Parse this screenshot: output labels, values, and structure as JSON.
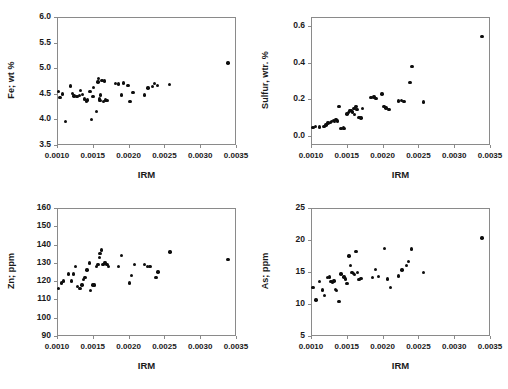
{
  "figure": {
    "panel_count": 4,
    "shared_xlabel": "IRM",
    "marker_color": "#0d0d0d",
    "axis_color": "#8a8a8a",
    "background": "#ffffff"
  },
  "chart_data": [
    {
      "type": "scatter",
      "title": "",
      "xlabel": "IRM",
      "ylabel": "Fe; wt %",
      "xlim": [
        0.001,
        0.0035
      ],
      "ylim": [
        3.5,
        6.0
      ],
      "xticks": [
        0.001,
        0.0015,
        0.002,
        0.0025,
        0.003,
        0.0035
      ],
      "xticklabels": [
        "0.0010",
        "0.0015",
        "0.0020",
        "0.0025",
        "0.0030",
        "0.0035"
      ],
      "yticks": [
        3.5,
        4.0,
        4.5,
        5.0,
        5.5,
        6.0
      ],
      "yticklabels": [
        "3.5",
        "4.0",
        "4.5",
        "5.0",
        "5.5",
        "6.0"
      ],
      "grid": false,
      "legend": false,
      "x": [
        0.00102,
        0.00104,
        0.00108,
        0.00112,
        0.00119,
        0.00122,
        0.00124,
        0.00128,
        0.00131,
        0.00133,
        0.00136,
        0.00138,
        0.00141,
        0.00143,
        0.00146,
        0.00148,
        0.0015,
        0.00151,
        0.00155,
        0.00157,
        0.00158,
        0.00159,
        0.0016,
        0.00161,
        0.00163,
        0.00165,
        0.00166,
        0.00168,
        0.0017,
        0.00182,
        0.00186,
        0.0019,
        0.00193,
        0.00199,
        0.00202,
        0.00206,
        0.00222,
        0.00227,
        0.00233,
        0.00236,
        0.0024,
        0.00257,
        0.00339
      ],
      "y": [
        4.55,
        4.43,
        4.5,
        3.96,
        4.65,
        4.51,
        4.46,
        4.45,
        4.47,
        4.57,
        4.49,
        4.4,
        4.36,
        4.38,
        4.55,
        4.0,
        4.45,
        4.62,
        4.16,
        4.73,
        4.8,
        4.4,
        4.37,
        4.48,
        4.76,
        4.35,
        4.75,
        4.38,
        4.37,
        4.7,
        4.69,
        4.48,
        4.71,
        4.66,
        4.35,
        4.52,
        4.48,
        4.61,
        4.64,
        4.7,
        4.66,
        4.68,
        5.1
      ]
    },
    {
      "type": "scatter",
      "title": "",
      "xlabel": "IRM",
      "ylabel": "Sulfur, wtr. %",
      "xlim": [
        0.001,
        0.0035
      ],
      "ylim": [
        -0.05,
        0.65
      ],
      "xticks": [
        0.001,
        0.0015,
        0.002,
        0.0025,
        0.003,
        0.0035
      ],
      "xticklabels": [
        "0.0010",
        "0.0015",
        "0.0020",
        "0.0025",
        "0.0030",
        "0.0035"
      ],
      "yticks": [
        0.0,
        0.2,
        0.4,
        0.6
      ],
      "yticklabels": [
        "0.0",
        "0.2",
        "0.4",
        "0.6"
      ],
      "grid": false,
      "legend": false,
      "x": [
        0.00103,
        0.00106,
        0.00112,
        0.00118,
        0.00121,
        0.00124,
        0.00127,
        0.00129,
        0.00131,
        0.00133,
        0.00135,
        0.00137,
        0.00139,
        0.00142,
        0.00145,
        0.00147,
        0.0015,
        0.00152,
        0.00154,
        0.00156,
        0.00158,
        0.0016,
        0.00161,
        0.00163,
        0.00164,
        0.00166,
        0.00168,
        0.0017,
        0.00172,
        0.00184,
        0.00188,
        0.00191,
        0.00199,
        0.00202,
        0.00205,
        0.00209,
        0.00222,
        0.00226,
        0.0023,
        0.00238,
        0.00241,
        0.00257,
        0.00339
      ],
      "y": [
        0.045,
        0.05,
        0.048,
        0.052,
        0.06,
        0.07,
        0.072,
        0.08,
        0.085,
        0.078,
        0.09,
        0.082,
        0.16,
        0.04,
        0.042,
        0.04,
        0.12,
        0.128,
        0.135,
        0.14,
        0.13,
        0.15,
        0.118,
        0.16,
        0.145,
        0.1,
        0.102,
        0.098,
        0.15,
        0.21,
        0.212,
        0.205,
        0.228,
        0.16,
        0.152,
        0.145,
        0.19,
        0.192,
        0.188,
        0.292,
        0.378,
        0.185,
        0.545
      ]
    },
    {
      "type": "scatter",
      "title": "",
      "xlabel": "IRM",
      "ylabel": "Zn; ppm",
      "xlim": [
        0.001,
        0.0035
      ],
      "ylim": [
        90,
        160
      ],
      "xticks": [
        0.001,
        0.0015,
        0.002,
        0.0025,
        0.003,
        0.0035
      ],
      "xticklabels": [
        "0.0010",
        "0.0015",
        "0.0020",
        "0.0025",
        "0.0030",
        "0.0035"
      ],
      "yticks": [
        90,
        100,
        110,
        120,
        130,
        140,
        150,
        160
      ],
      "yticklabels": [
        "90",
        "100",
        "110",
        "120",
        "130",
        "140",
        "150",
        "160"
      ],
      "grid": false,
      "legend": false,
      "x": [
        0.00102,
        0.00106,
        0.00109,
        0.00116,
        0.0012,
        0.00123,
        0.00126,
        0.00129,
        0.00131,
        0.00133,
        0.00135,
        0.00137,
        0.00139,
        0.00142,
        0.00145,
        0.00147,
        0.0015,
        0.00152,
        0.00155,
        0.00157,
        0.00159,
        0.0016,
        0.00162,
        0.00164,
        0.00166,
        0.00168,
        0.0017,
        0.00172,
        0.00186,
        0.0019,
        0.00201,
        0.00204,
        0.00208,
        0.00222,
        0.00226,
        0.0023,
        0.00238,
        0.00241,
        0.00258,
        0.00339
      ],
      "y": [
        116,
        119,
        120,
        124,
        120,
        124,
        128,
        117,
        116,
        116,
        118,
        121,
        122,
        126,
        130,
        115,
        118,
        118,
        128,
        129,
        133,
        135,
        137,
        129,
        130,
        130,
        129,
        128,
        128,
        134,
        119,
        123,
        129,
        129,
        128,
        128,
        122,
        125,
        136,
        132
      ]
    },
    {
      "type": "scatter",
      "title": "",
      "xlabel": "IRM",
      "ylabel": "As; ppm",
      "xlim": [
        0.001,
        0.0035
      ],
      "ylim": [
        5,
        25
      ],
      "xticks": [
        0.001,
        0.0015,
        0.002,
        0.0025,
        0.003,
        0.0035
      ],
      "xticklabels": [
        "0.0010",
        "0.0015",
        "0.0020",
        "0.0025",
        "0.0030",
        "0.0035"
      ],
      "yticks": [
        5,
        10,
        15,
        20,
        25
      ],
      "yticklabels": [
        "5",
        "10",
        "15",
        "20",
        "25"
      ],
      "grid": false,
      "legend": false,
      "x": [
        0.00103,
        0.00107,
        0.00112,
        0.00116,
        0.00119,
        0.00123,
        0.00126,
        0.00128,
        0.0013,
        0.00132,
        0.00134,
        0.00136,
        0.00139,
        0.00142,
        0.00146,
        0.00148,
        0.0015,
        0.00153,
        0.00155,
        0.00157,
        0.00159,
        0.00161,
        0.00163,
        0.00165,
        0.00167,
        0.0017,
        0.00186,
        0.0019,
        0.00194,
        0.00203,
        0.00207,
        0.00211,
        0.00222,
        0.00227,
        0.00233,
        0.00236,
        0.0024,
        0.00257,
        0.00339
      ],
      "y": [
        12.6,
        10.6,
        13.5,
        12.2,
        11.3,
        14.1,
        14.2,
        13.5,
        13.4,
        13.6,
        12.3,
        12.1,
        10.4,
        14.7,
        14.2,
        13.9,
        13.2,
        17.5,
        16.0,
        14.9,
        14.8,
        14.6,
        18.2,
        14.9,
        13.8,
        14.0,
        14.1,
        15.4,
        14.3,
        18.7,
        13.9,
        12.6,
        14.4,
        15.3,
        16.0,
        16.6,
        18.6,
        14.9,
        20.3
      ]
    }
  ]
}
